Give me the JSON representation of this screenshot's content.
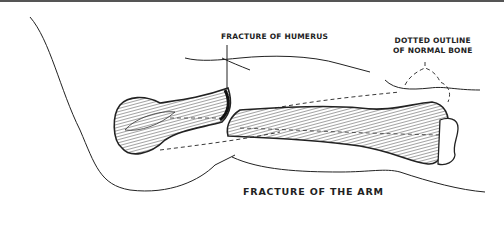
{
  "diagram": {
    "title": "FRACTURE OF THE ARM",
    "labels": {
      "fracture_site": "FRACTURE OF HUMERUS",
      "dotted_outline_line1": "DOTTED OUTLINE",
      "dotted_outline_line2": "OF NORMAL BONE"
    },
    "elements": [
      "arm-outline",
      "humerus-proximal-fragment",
      "humerus-distal-fragment",
      "dotted-normal-bone-outline",
      "elbow-joint"
    ],
    "colors": {
      "ink": "#222222",
      "paper": "#ffffff",
      "frame": "#555555"
    }
  }
}
